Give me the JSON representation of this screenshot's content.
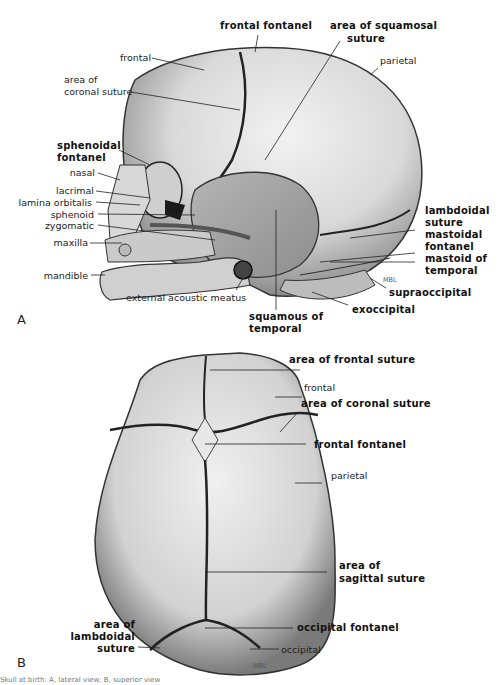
{
  "figure": {
    "panel_a": {
      "letter": "A",
      "signature": "MBL",
      "labels": {
        "frontal_fontanel": "frontal fontanel",
        "squamosal_1": "area of squamosal",
        "squamosal_2": "suture",
        "frontal": "frontal",
        "parietal": "parietal",
        "coronal_1": "area of",
        "coronal_2": "coronal suture",
        "sphenoidal_1": "sphenoidal",
        "sphenoidal_2": "fontanel",
        "nasal": "nasal",
        "lacrimal": "lacrimal",
        "lamina_orbitalis": "lamina orbitalis",
        "sphenoid": "sphenoid",
        "zygomatic": "zygomatic",
        "maxilla": "maxilla",
        "mandible": "mandible",
        "external_acoustic_meatus": "external acoustic meatus",
        "lambdoidal_1": "lambdoidal",
        "lambdoidal_2": "suture",
        "mastoidal_1": "mastoidal",
        "mastoidal_2": "fontanel",
        "mastoid_1": "mastoid of",
        "mastoid_2": "temporal",
        "supraoccipital": "supraoccipital",
        "exoccipital": "exoccipital",
        "squamous_1": "squamous of",
        "squamous_2": "temporal"
      }
    },
    "panel_b": {
      "letter": "B",
      "signature": "MBL",
      "labels": {
        "frontal_suture": "area of frontal suture",
        "frontal": "frontal",
        "coronal_suture": "area of coronal suture",
        "frontal_fontanel": "frontal fontanel",
        "parietal": "parietal",
        "sagittal_1": "area of",
        "sagittal_2": "sagittal suture",
        "occipital_fontanel": "occipital fontanel",
        "occipital": "occipital",
        "lambdoidal_1": "area of",
        "lambdoidal_2": "lambdoidal",
        "lambdoidal_3": "suture"
      }
    },
    "caption_fragment": "Skull at birth: A, lateral view; B, superior view"
  }
}
